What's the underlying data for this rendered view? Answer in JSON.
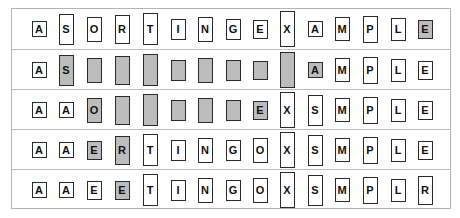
{
  "colors": {
    "highlight": "#bcbcbc",
    "border": "#2a2a2a",
    "frame": "#b4b4b4"
  },
  "rows": [
    {
      "cells": [
        {
          "key": "A",
          "shade": false,
          "label": true
        },
        {
          "key": "S",
          "shade": false,
          "label": true
        },
        {
          "key": "O",
          "shade": false,
          "label": true
        },
        {
          "key": "R",
          "shade": false,
          "label": true
        },
        {
          "key": "T",
          "shade": false,
          "label": true
        },
        {
          "key": "I",
          "shade": false,
          "label": true
        },
        {
          "key": "N",
          "shade": false,
          "label": true
        },
        {
          "key": "G",
          "shade": false,
          "label": true
        },
        {
          "key": "E",
          "shade": false,
          "label": true
        },
        {
          "key": "X",
          "shade": false,
          "label": true
        },
        {
          "key": "A",
          "shade": false,
          "label": true
        },
        {
          "key": "M",
          "shade": false,
          "label": true
        },
        {
          "key": "P",
          "shade": false,
          "label": true
        },
        {
          "key": "L",
          "shade": false,
          "label": true
        },
        {
          "key": "E",
          "shade": true,
          "label": true
        }
      ]
    },
    {
      "cells": [
        {
          "key": "A",
          "shade": false,
          "label": true
        },
        {
          "key": "S",
          "shade": true,
          "label": true
        },
        {
          "key": "O",
          "shade": true,
          "label": false
        },
        {
          "key": "R",
          "shade": true,
          "label": false
        },
        {
          "key": "T",
          "shade": true,
          "label": false
        },
        {
          "key": "I",
          "shade": true,
          "label": false
        },
        {
          "key": "N",
          "shade": true,
          "label": false
        },
        {
          "key": "G",
          "shade": true,
          "label": false
        },
        {
          "key": "E",
          "shade": true,
          "label": false
        },
        {
          "key": "X",
          "shade": true,
          "label": false
        },
        {
          "key": "A",
          "shade": true,
          "label": true
        },
        {
          "key": "M",
          "shade": false,
          "label": true
        },
        {
          "key": "P",
          "shade": false,
          "label": true
        },
        {
          "key": "L",
          "shade": false,
          "label": true
        },
        {
          "key": "E",
          "shade": false,
          "label": true
        }
      ]
    },
    {
      "cells": [
        {
          "key": "A",
          "shade": false,
          "label": true
        },
        {
          "key": "A",
          "shade": false,
          "label": true
        },
        {
          "key": "O",
          "shade": true,
          "label": true
        },
        {
          "key": "R",
          "shade": true,
          "label": false
        },
        {
          "key": "T",
          "shade": true,
          "label": false
        },
        {
          "key": "I",
          "shade": true,
          "label": false
        },
        {
          "key": "N",
          "shade": true,
          "label": false
        },
        {
          "key": "G",
          "shade": true,
          "label": false
        },
        {
          "key": "E",
          "shade": true,
          "label": true
        },
        {
          "key": "X",
          "shade": false,
          "label": true
        },
        {
          "key": "S",
          "shade": false,
          "label": true
        },
        {
          "key": "M",
          "shade": false,
          "label": true
        },
        {
          "key": "P",
          "shade": false,
          "label": true
        },
        {
          "key": "L",
          "shade": false,
          "label": true
        },
        {
          "key": "E",
          "shade": false,
          "label": true
        }
      ]
    },
    {
      "cells": [
        {
          "key": "A",
          "shade": false,
          "label": true
        },
        {
          "key": "A",
          "shade": false,
          "label": true
        },
        {
          "key": "E",
          "shade": true,
          "label": true
        },
        {
          "key": "R",
          "shade": true,
          "label": true
        },
        {
          "key": "T",
          "shade": false,
          "label": true
        },
        {
          "key": "I",
          "shade": false,
          "label": true
        },
        {
          "key": "N",
          "shade": false,
          "label": true
        },
        {
          "key": "G",
          "shade": false,
          "label": true
        },
        {
          "key": "O",
          "shade": false,
          "label": true
        },
        {
          "key": "X",
          "shade": false,
          "label": true
        },
        {
          "key": "S",
          "shade": false,
          "label": true
        },
        {
          "key": "M",
          "shade": false,
          "label": true
        },
        {
          "key": "P",
          "shade": false,
          "label": true
        },
        {
          "key": "L",
          "shade": false,
          "label": true
        },
        {
          "key": "E",
          "shade": false,
          "label": true
        }
      ]
    },
    {
      "cells": [
        {
          "key": "A",
          "shade": false,
          "label": true
        },
        {
          "key": "A",
          "shade": false,
          "label": true
        },
        {
          "key": "E",
          "shade": false,
          "label": true
        },
        {
          "key": "E",
          "shade": true,
          "label": true
        },
        {
          "key": "T",
          "shade": false,
          "label": true
        },
        {
          "key": "I",
          "shade": false,
          "label": true
        },
        {
          "key": "N",
          "shade": false,
          "label": true
        },
        {
          "key": "G",
          "shade": false,
          "label": true
        },
        {
          "key": "O",
          "shade": false,
          "label": true
        },
        {
          "key": "X",
          "shade": false,
          "label": true
        },
        {
          "key": "S",
          "shade": false,
          "label": true
        },
        {
          "key": "M",
          "shade": false,
          "label": true
        },
        {
          "key": "P",
          "shade": false,
          "label": true
        },
        {
          "key": "L",
          "shade": false,
          "label": true
        },
        {
          "key": "R",
          "shade": false,
          "label": true
        }
      ]
    }
  ]
}
